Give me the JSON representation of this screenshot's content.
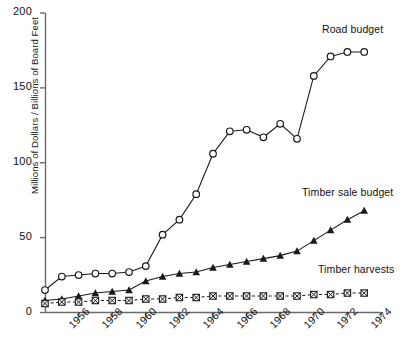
{
  "chart_data": {
    "type": "line",
    "title": "",
    "subtitle": "",
    "xlabel": "",
    "ylabel": "Millions of Dollars / Billions of Board Feet",
    "xlim": [
      1954,
      1974
    ],
    "ylim": [
      0,
      200
    ],
    "grid": false,
    "legend_position": "inline-right",
    "x_ticks": [
      1956,
      1958,
      1960,
      1962,
      1964,
      1966,
      1968,
      1970,
      1972,
      1974
    ],
    "x_tick_labels": [
      "1956",
      "1958",
      "1960",
      "1962",
      "1964",
      "1966",
      "1968",
      "1970",
      "1972",
      "1974"
    ],
    "y_ticks": [
      0,
      50,
      100,
      150,
      200
    ],
    "y_tick_labels": [
      "0",
      "50",
      "100",
      "150",
      "200"
    ],
    "x": [
      1954,
      1955,
      1956,
      1957,
      1958,
      1959,
      1960,
      1961,
      1962,
      1963,
      1964,
      1965,
      1966,
      1967,
      1968,
      1969,
      1970,
      1971,
      1972,
      1973
    ],
    "series": [
      {
        "name": "Road budget",
        "label": "Road budget",
        "marker": "open-circle",
        "line_style": "solid",
        "color": "#1a1a1a",
        "values": [
          15,
          24,
          25,
          26,
          26,
          27,
          31,
          52,
          62,
          79,
          106,
          121,
          122,
          117,
          126,
          116,
          158,
          171,
          174,
          174
        ]
      },
      {
        "name": "Timber sale budget",
        "label": "Timber sale budget",
        "marker": "filled-triangle",
        "line_style": "solid",
        "color": "#1a1a1a",
        "values": [
          8,
          9,
          11,
          13,
          14,
          15,
          21,
          24,
          26,
          27,
          30,
          32,
          34,
          36,
          38,
          41,
          48,
          55,
          62,
          68
        ]
      },
      {
        "name": "Timber harvests",
        "label": "Timber harvests",
        "marker": "crossed-square",
        "line_style": "dashed",
        "color": "#1a1a1a",
        "values": [
          6,
          7,
          7,
          8,
          8,
          8,
          9,
          9,
          10,
          10,
          11,
          11,
          11,
          11,
          11,
          11,
          12,
          12,
          13,
          13
        ]
      }
    ]
  },
  "axes": {
    "y_axis_title": "Millions of Dollars / Billions of Board Feet"
  }
}
